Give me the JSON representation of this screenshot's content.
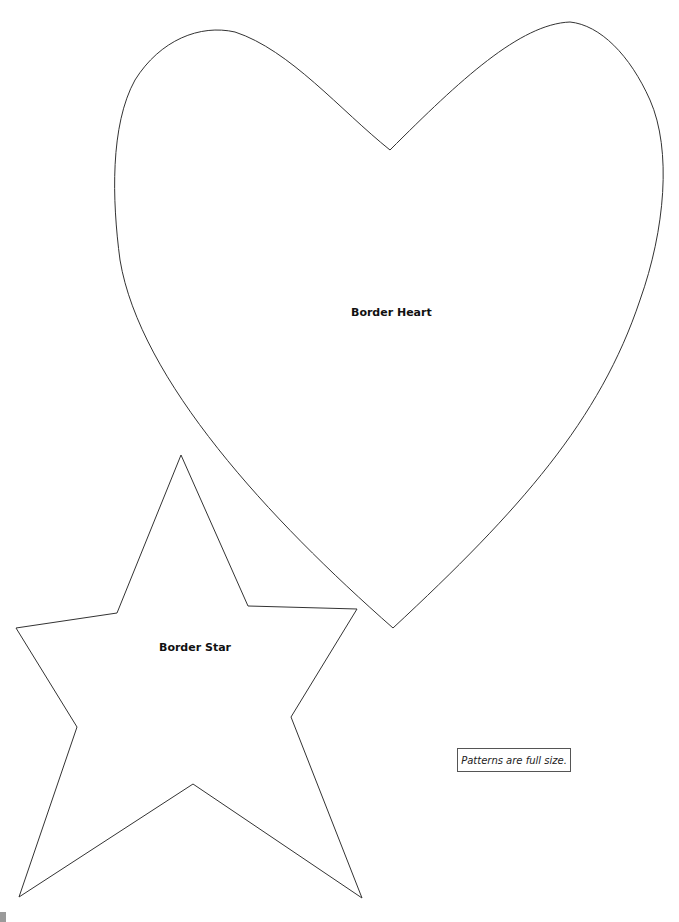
{
  "document": {
    "type": "sewing pattern sheet",
    "shapes": [
      {
        "name": "Border Heart",
        "label": "Border Heart"
      },
      {
        "name": "Border Star",
        "label": "Border Star"
      }
    ],
    "note": "Patterns are full size.",
    "colors": {
      "outline": "#333333",
      "background": "#ffffff",
      "text": "#111111"
    }
  }
}
